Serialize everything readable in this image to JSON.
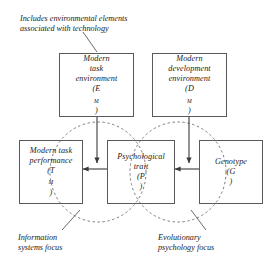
{
  "figure": {
    "background_color": "#ffffff",
    "line_color": "#59595c",
    "text_color": "#1a1a1a"
  },
  "annotations": {
    "top_note": "Includes environmental elements\nassociated with technology",
    "left_focus": "Information\nsystems focus",
    "right_focus": "Evolutionary\npsychology focus"
  },
  "nodes": {
    "modern_task_environment": {
      "line1": "Modern",
      "line2": "task",
      "line3": "environment",
      "symbol_open": "(E",
      "symbol_sub": "M",
      "symbol_close": ")"
    },
    "modern_development_environment": {
      "line1": "Modern",
      "line2": "development",
      "line3": "environment",
      "symbol_open": "(D",
      "symbol_sub": "M",
      "symbol_close": ")"
    },
    "modern_task_performance": {
      "line1": "Modern task",
      "line2": "performance",
      "symbol_open": "(T",
      "symbol_sub": "M",
      "symbol_close": ")"
    },
    "psychological_trait": {
      "line1": "Psychological",
      "line2": "trait",
      "symbol_open": "(P",
      "symbol_sub": "",
      "symbol_close": ")"
    },
    "genotype": {
      "line1": "Genotype",
      "line2": "",
      "symbol_open": "(G",
      "symbol_sub": "",
      "symbol_close": ")"
    }
  },
  "regions": {
    "information_systems_circle": "Information systems focus region",
    "evolutionary_psychology_circle": "Evolutionary psychology focus region"
  },
  "edges": {
    "env_to_trait": "Modern task environment to Psychological trait",
    "dev_to_trait": "Modern development environment to Psychological trait",
    "trait_to_performance": "Psychological trait to Modern task performance",
    "genotype_to_trait": "Genotype to Psychological trait",
    "note_leader": "leader line from top note to Modern task environment box",
    "left_focus_leader": "leader line from Information systems focus to left circle",
    "right_focus_leader": "leader line from Evolutionary psychology focus to right circle"
  }
}
